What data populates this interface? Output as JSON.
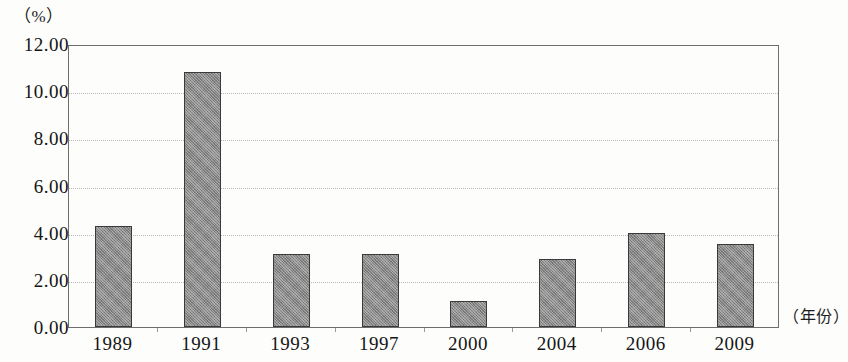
{
  "chart_data": {
    "type": "bar",
    "title": "",
    "subtitle": "",
    "xlabel": "（年份）",
    "ylabel": "（%）",
    "categories": [
      "1989",
      "1991",
      "1993",
      "1997",
      "2000",
      "2004",
      "2006",
      "2009"
    ],
    "values": [
      4.3,
      10.8,
      3.1,
      3.1,
      1.1,
      2.9,
      4.0,
      3.5
    ],
    "ylim": [
      0.0,
      12.0
    ],
    "ytick_labels": [
      "12.00",
      "10.00",
      "8.00",
      "6.00",
      "4.00",
      "2.00",
      "0.00"
    ],
    "ytick_values": [
      12.0,
      10.0,
      8.0,
      6.0,
      4.0,
      2.0,
      0.0
    ],
    "grid": true,
    "legend": null,
    "legend_position": "none",
    "annotations": [],
    "bar_color": "#888888",
    "bar_border_color": "#3a3a3a",
    "gridline_color": "#b9b9b9",
    "axis_color": "#6e6e6e",
    "background_color": "#fdfdfc",
    "text_color": "#151515"
  }
}
